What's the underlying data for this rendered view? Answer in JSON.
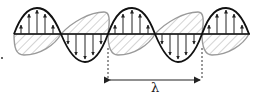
{
  "diagram": {
    "wavelength_label": "λ",
    "colors": {
      "electric_field": "#111111",
      "magnetic_field": "#9a9a9a",
      "axis": "#111111",
      "marker": "#333333"
    },
    "electric_field": {
      "label": "",
      "arrows": "vertical"
    },
    "magnetic_field": {
      "label": "",
      "style": "hatched"
    }
  }
}
